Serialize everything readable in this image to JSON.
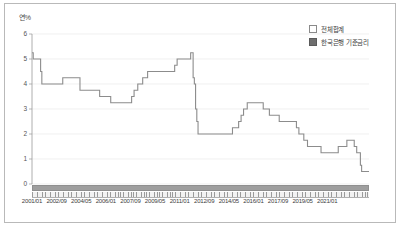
{
  "chart_data": {
    "type": "line",
    "title": "",
    "xlabel": "",
    "ylabel": "연%",
    "ylim": [
      0,
      6
    ],
    "yticks": [
      0,
      1,
      2,
      3,
      4,
      5,
      6
    ],
    "grid": true,
    "legend_position": "top-right",
    "legend": [
      {
        "marker": "light-square",
        "label": "전체합계"
      },
      {
        "marker": "dark-square",
        "label": "한국은행 기준금리"
      }
    ],
    "xtick_labels": [
      "2001/01",
      "2002/09",
      "2004/05",
      "2006/01",
      "2007/09",
      "2009/05",
      "2011/01",
      "2012/09",
      "2014/05",
      "2016/01",
      "2017/09",
      "2019/05",
      "2021/01"
    ],
    "xtick_index": [
      0,
      20,
      40,
      60,
      80,
      100,
      120,
      140,
      160,
      180,
      200,
      220,
      240
    ],
    "x_start": "2001/01",
    "x_end": "2021/01",
    "series": [
      {
        "name": "한국은행 기준금리",
        "unit": "연%",
        "values": [
          5.25,
          5.0,
          5.0,
          5.0,
          5.0,
          5.0,
          5.0,
          4.5,
          4.0,
          4.0,
          4.0,
          4.0,
          4.0,
          4.0,
          4.0,
          4.0,
          4.0,
          4.0,
          4.0,
          4.0,
          4.0,
          4.0,
          4.0,
          4.0,
          4.0,
          4.25,
          4.25,
          4.25,
          4.25,
          4.25,
          4.25,
          4.25,
          4.25,
          4.25,
          4.25,
          4.25,
          4.25,
          4.25,
          4.25,
          3.75,
          3.75,
          3.75,
          3.75,
          3.75,
          3.75,
          3.75,
          3.75,
          3.75,
          3.75,
          3.75,
          3.75,
          3.75,
          3.75,
          3.75,
          3.75,
          3.5,
          3.5,
          3.5,
          3.5,
          3.5,
          3.5,
          3.5,
          3.5,
          3.5,
          3.25,
          3.25,
          3.25,
          3.25,
          3.25,
          3.25,
          3.25,
          3.25,
          3.25,
          3.25,
          3.25,
          3.25,
          3.25,
          3.25,
          3.25,
          3.25,
          3.25,
          3.5,
          3.5,
          3.75,
          3.75,
          3.75,
          4.0,
          4.0,
          4.0,
          4.0,
          4.25,
          4.25,
          4.25,
          4.25,
          4.5,
          4.5,
          4.5,
          4.5,
          4.5,
          4.5,
          4.5,
          4.5,
          4.5,
          4.5,
          4.5,
          4.5,
          4.5,
          4.5,
          4.5,
          4.5,
          4.5,
          4.5,
          4.5,
          4.5,
          4.5,
          4.5,
          4.75,
          4.75,
          5.0,
          5.0,
          5.0,
          5.0,
          5.0,
          5.0,
          5.0,
          5.0,
          5.0,
          5.0,
          5.0,
          5.25,
          5.25,
          4.25,
          4.0,
          3.0,
          2.5,
          2.0,
          2.0,
          2.0,
          2.0,
          2.0,
          2.0,
          2.0,
          2.0,
          2.0,
          2.0,
          2.0,
          2.0,
          2.0,
          2.0,
          2.0,
          2.0,
          2.0,
          2.0,
          2.0,
          2.0,
          2.0,
          2.0,
          2.0,
          2.0,
          2.0,
          2.0,
          2.0,
          2.0,
          2.25,
          2.25,
          2.25,
          2.25,
          2.25,
          2.5,
          2.5,
          2.75,
          2.75,
          3.0,
          3.0,
          3.0,
          3.25,
          3.25,
          3.25,
          3.25,
          3.25,
          3.25,
          3.25,
          3.25,
          3.25,
          3.25,
          3.25,
          3.25,
          3.25,
          3.0,
          3.0,
          3.0,
          3.0,
          3.0,
          2.75,
          2.75,
          2.75,
          2.75,
          2.75,
          2.75,
          2.75,
          2.75,
          2.5,
          2.5,
          2.5,
          2.5,
          2.5,
          2.5,
          2.5,
          2.5,
          2.5,
          2.5,
          2.5,
          2.5,
          2.5,
          2.5,
          2.25,
          2.25,
          2.0,
          2.0,
          2.0,
          2.0,
          1.75,
          1.75,
          1.75,
          1.5,
          1.5,
          1.5,
          1.5,
          1.5,
          1.5,
          1.5,
          1.5,
          1.5,
          1.5,
          1.5,
          1.25,
          1.25,
          1.25,
          1.25,
          1.25,
          1.25,
          1.25,
          1.25,
          1.25,
          1.25,
          1.25,
          1.25,
          1.25,
          1.25,
          1.5,
          1.5,
          1.5,
          1.5,
          1.5,
          1.5,
          1.5,
          1.75,
          1.75,
          1.75,
          1.75,
          1.75,
          1.75,
          1.5,
          1.5,
          1.25,
          1.25,
          1.25,
          0.75,
          0.5,
          0.5,
          0.5,
          0.5,
          0.5,
          0.5,
          0.5
        ]
      }
    ]
  }
}
